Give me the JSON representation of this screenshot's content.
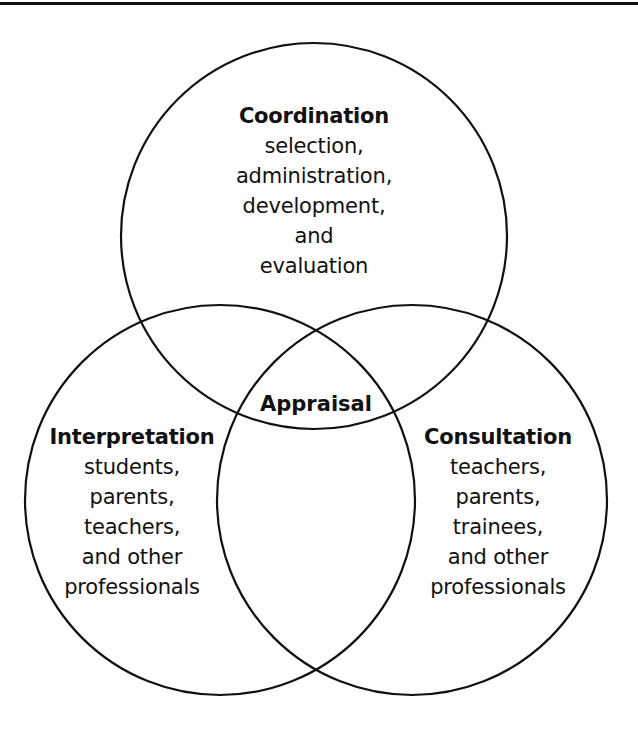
{
  "diagram": {
    "type": "venn",
    "colors": {
      "stroke": "#111111",
      "background": "#ffffff"
    },
    "circles": [
      {
        "id": "coordination",
        "title": "Coordination",
        "lines": [
          "selection,",
          "administration,",
          "development,",
          "and",
          "evaluation"
        ]
      },
      {
        "id": "interpretation",
        "title": "Interpretation",
        "lines": [
          "students,",
          "parents,",
          "teachers,",
          "and other",
          "professionals"
        ]
      },
      {
        "id": "consultation",
        "title": "Consultation",
        "lines": [
          "teachers,",
          "parents,",
          "trainees,",
          "and other",
          "professionals"
        ]
      }
    ],
    "center_label": "Appraisal"
  }
}
